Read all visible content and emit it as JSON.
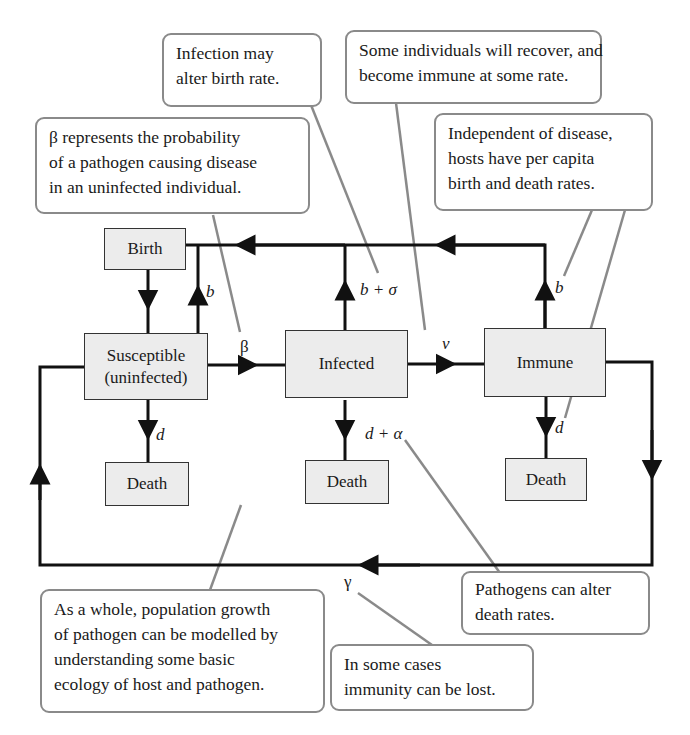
{
  "diagram": {
    "type": "compartment-flow-diagram",
    "nodes": {
      "birth": "Birth",
      "susceptible_line1": "Susceptible",
      "susceptible_line2": "(uninfected)",
      "infected": "Infected",
      "immune": "Immune",
      "death_s": "Death",
      "death_i": "Death",
      "death_r": "Death"
    },
    "edge_labels": {
      "s_birth": "b",
      "s_death": "d",
      "beta": "β",
      "i_birth": "b + σ",
      "i_death": "d + α",
      "v": "v",
      "r_birth": "b",
      "r_death": "d",
      "gamma": "γ"
    },
    "callouts": {
      "infection_birth": [
        "Infection may",
        "alter birth rate."
      ],
      "recover": [
        "Some individuals will recover, and",
        "become immune at some rate."
      ],
      "beta": [
        "β represents the probability",
        "of a pathogen causing disease",
        "in an uninfected individual."
      ],
      "independent": [
        "Independent of disease,",
        "hosts have per capita",
        "birth and death rates."
      ],
      "population": [
        "As a whole, population growth",
        "of pathogen can be modelled by",
        "understanding some basic",
        "ecology of host and pathogen."
      ],
      "death_rates": [
        "Pathogens can alter",
        "death rates."
      ],
      "immunity_lost": [
        "In some cases",
        "immunity can be lost."
      ]
    },
    "colors": {
      "node_fill": "#ececec",
      "callout_border": "#8a8a8a",
      "leader_line": "#8a8a8a",
      "flow_line": "#111111"
    }
  }
}
